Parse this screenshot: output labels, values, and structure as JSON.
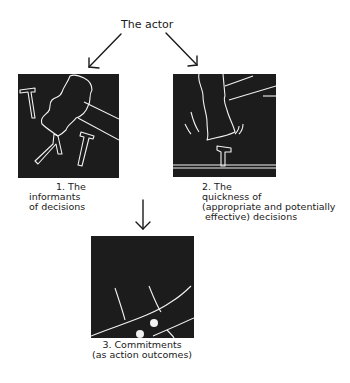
{
  "title": "The actor",
  "colors": {
    "panel_bg": "#1c1c1c",
    "line": "#f2f2f2",
    "text": "#1a1a1a"
  },
  "panels": [
    {
      "id": 1,
      "illustration": "hand-dropping-nails",
      "caption": [
        "1. The",
        "informants",
        "of decisions"
      ]
    },
    {
      "id": 2,
      "illustration": "hand-hitting-nail",
      "caption": [
        "2. The",
        "quickness of",
        "(appropriate and potentially",
        " effective) decisions"
      ]
    },
    {
      "id": 3,
      "illustration": "nailed-surface-closeup",
      "caption": [
        "3. Commitments",
        "(as action outcomes)"
      ]
    }
  ],
  "arrows": [
    {
      "from": "The actor",
      "to": "panel-1"
    },
    {
      "from": "The actor",
      "to": "panel-2"
    },
    {
      "from": "panels-1-2",
      "to": "panel-3"
    }
  ]
}
